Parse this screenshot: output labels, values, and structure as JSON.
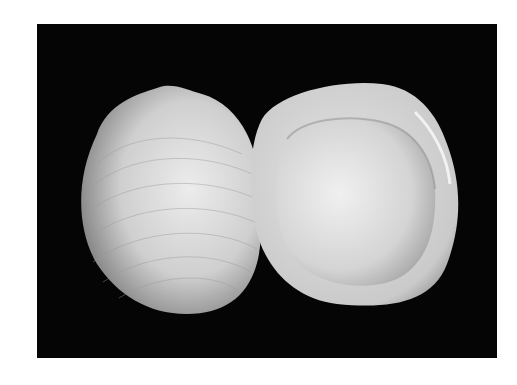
{
  "image": {
    "subject": "Two clam shell valves on black background",
    "alt": "Photograph of two white bivalve shells: left valve showing exterior with concentric growth lines, right valve showing interior",
    "colors": {
      "background": "#050505",
      "shell_light": "#e8e8e8",
      "shell_mid": "#bdbdbd",
      "shell_dark": "#6a6a6a",
      "page": "#ffffff"
    }
  }
}
